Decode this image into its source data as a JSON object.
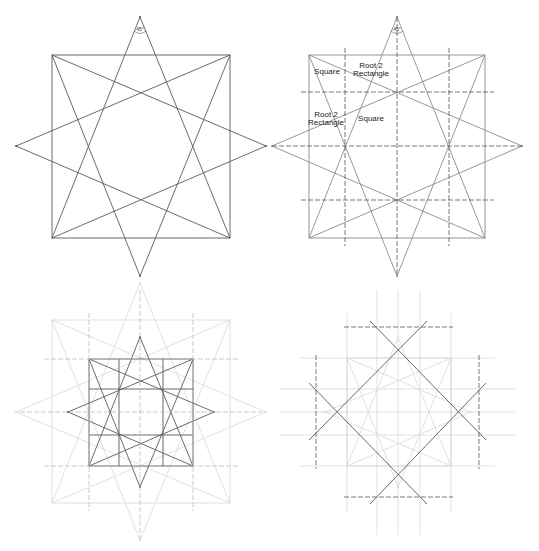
{
  "figure": {
    "width": 539,
    "height": 551
  },
  "colors": {
    "dark_line": "#5a5a5a",
    "mid_line": "#8c8c8c",
    "faint_line": "#d8d8d8",
    "dash_dark": "#555555",
    "dash_faint": "#bdbdbd",
    "text": "#222222"
  },
  "panels": [
    {
      "id": "panel-1",
      "name": "star-from-square-and-diamond",
      "angle_label": "45°",
      "angle_pos": [
        140,
        33
      ],
      "stars": [
        {
          "style": "dark",
          "square": [
            52,
            55,
            230,
            238
          ],
          "diamond": {
            "top": [
              140,
              17
            ],
            "right": [
              266,
              146
            ],
            "bottom": [
              140,
              276
            ],
            "left": [
              16,
              146
            ]
          }
        }
      ],
      "dashed": [],
      "labels": []
    },
    {
      "id": "panel-2",
      "name": "proportion-grid",
      "angle_label": "45°",
      "angle_pos": [
        397,
        33
      ],
      "stars": [
        {
          "style": "mid",
          "square": [
            309,
            55,
            485,
            238
          ],
          "diamond": {
            "top": [
              397,
              17
            ],
            "right": [
              522,
              146
            ],
            "bottom": [
              397,
              276
            ],
            "left": [
              272,
              146
            ]
          }
        }
      ],
      "dashed": [
        {
          "style": "dark",
          "x1": 345,
          "y1": 48,
          "x2": 345,
          "y2": 246
        },
        {
          "style": "dark",
          "x1": 397,
          "y1": 17,
          "x2": 397,
          "y2": 276
        },
        {
          "style": "dark",
          "x1": 449,
          "y1": 48,
          "x2": 449,
          "y2": 246
        },
        {
          "style": "dark",
          "x1": 301,
          "y1": 92,
          "x2": 494,
          "y2": 92
        },
        {
          "style": "dark",
          "x1": 272,
          "y1": 146,
          "x2": 522,
          "y2": 146
        },
        {
          "style": "dark",
          "x1": 301,
          "y1": 200,
          "x2": 494,
          "y2": 200
        }
      ],
      "labels": [
        {
          "lines": [
            "Square"
          ],
          "x": 327,
          "y": 74
        },
        {
          "lines": [
            "Root 2",
            "Rectangle"
          ],
          "x": 371,
          "y": 68
        },
        {
          "lines": [
            "Root 2",
            "Rectangle"
          ],
          "x": 326,
          "y": 117
        },
        {
          "lines": [
            "Square"
          ],
          "x": 371,
          "y": 121
        }
      ]
    },
    {
      "id": "panel-3",
      "name": "nested-inner-star",
      "angle_label": "",
      "stars": [
        {
          "style": "faint",
          "square": [
            52,
            320,
            230,
            503
          ],
          "diamond": {
            "top": [
              140,
              283
            ],
            "right": [
              266,
              412
            ],
            "bottom": [
              140,
              540
            ],
            "left": [
              16,
              412
            ]
          }
        },
        {
          "style": "dark",
          "square": [
            89,
            359,
            193,
            466
          ],
          "diamond": {
            "top": [
              140,
              337
            ],
            "right": [
              214,
              412
            ],
            "bottom": [
              140,
              487
            ],
            "left": [
              68,
              412
            ]
          }
        }
      ],
      "inner_grid": [
        {
          "x1": 119,
          "y1": 359,
          "x2": 119,
          "y2": 466
        },
        {
          "x1": 163,
          "y1": 359,
          "x2": 163,
          "y2": 466
        },
        {
          "x1": 89,
          "y1": 389,
          "x2": 193,
          "y2": 389
        },
        {
          "x1": 89,
          "y1": 435,
          "x2": 193,
          "y2": 435
        }
      ],
      "dashed": [
        {
          "style": "mid",
          "x1": 89,
          "y1": 313,
          "x2": 89,
          "y2": 511
        },
        {
          "style": "mid",
          "x1": 140,
          "y1": 290,
          "x2": 140,
          "y2": 540
        },
        {
          "style": "mid",
          "x1": 193,
          "y1": 313,
          "x2": 193,
          "y2": 511
        },
        {
          "style": "mid",
          "x1": 44,
          "y1": 359,
          "x2": 238,
          "y2": 359
        },
        {
          "style": "mid",
          "x1": 20,
          "y1": 412,
          "x2": 262,
          "y2": 412
        },
        {
          "style": "mid",
          "x1": 44,
          "y1": 466,
          "x2": 238,
          "y2": 466
        }
      ],
      "labels": []
    },
    {
      "id": "panel-4",
      "name": "tilted-square-extension",
      "angle_label": "",
      "stars": [
        {
          "style": "faint",
          "square": [
            347,
            358,
            451,
            466
          ],
          "diamond": {
            "top": [
              398,
              337
            ],
            "right": [
              471,
              412
            ],
            "bottom": [
              398,
              487
            ],
            "left": [
              325,
              412
            ]
          }
        }
      ],
      "faint_grid": [
        {
          "x1": 347,
          "y1": 313,
          "x2": 347,
          "y2": 512
        },
        {
          "x1": 377,
          "y1": 290,
          "x2": 377,
          "y2": 535
        },
        {
          "x1": 398,
          "y1": 290,
          "x2": 398,
          "y2": 535
        },
        {
          "x1": 420,
          "y1": 290,
          "x2": 420,
          "y2": 535
        },
        {
          "x1": 451,
          "y1": 313,
          "x2": 451,
          "y2": 512
        },
        {
          "x1": 300,
          "y1": 358,
          "x2": 495,
          "y2": 358
        },
        {
          "x1": 280,
          "y1": 389,
          "x2": 515,
          "y2": 389
        },
        {
          "x1": 280,
          "y1": 412,
          "x2": 515,
          "y2": 412
        },
        {
          "x1": 280,
          "y1": 435,
          "x2": 515,
          "y2": 435
        },
        {
          "x1": 300,
          "y1": 466,
          "x2": 495,
          "y2": 466
        }
      ],
      "diagonals": [
        {
          "x1": 370,
          "y1": 321,
          "x2": 486,
          "y2": 440
        },
        {
          "x1": 427,
          "y1": 321,
          "x2": 309,
          "y2": 440
        },
        {
          "x1": 309,
          "y1": 383,
          "x2": 427,
          "y2": 504
        },
        {
          "x1": 486,
          "y1": 383,
          "x2": 370,
          "y2": 504
        }
      ],
      "dashed": [
        {
          "style": "dark",
          "x1": 344,
          "y1": 327,
          "x2": 453,
          "y2": 327
        },
        {
          "style": "dark",
          "x1": 344,
          "y1": 497,
          "x2": 453,
          "y2": 497
        },
        {
          "style": "dark",
          "x1": 316,
          "y1": 355,
          "x2": 316,
          "y2": 469
        },
        {
          "style": "dark",
          "x1": 479,
          "y1": 355,
          "x2": 479,
          "y2": 469
        }
      ],
      "labels": []
    }
  ]
}
